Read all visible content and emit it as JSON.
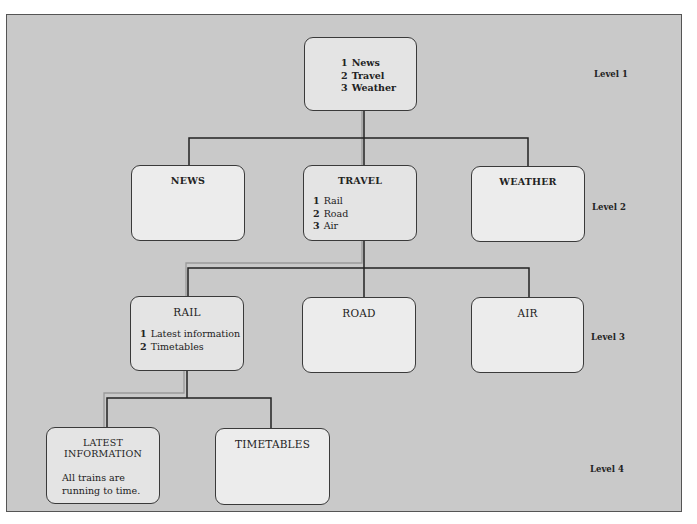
{
  "diagram": {
    "type": "menu-hierarchy",
    "colors": {
      "background": "#c9c9c9",
      "box_fill": "#e4e4e4",
      "box_fill_light": "#ececec",
      "connector": "#222222",
      "path_highlight": "#9a9a9a"
    },
    "levels": [
      {
        "label": "Level 1"
      },
      {
        "label": "Level 2"
      },
      {
        "label": "Level 3"
      },
      {
        "label": "Level 4"
      }
    ],
    "nodes": {
      "root": {
        "items": [
          {
            "num": "1",
            "label": "News"
          },
          {
            "num": "2",
            "label": "Travel"
          },
          {
            "num": "3",
            "label": "Weather"
          }
        ]
      },
      "news": {
        "title": "NEWS"
      },
      "travel": {
        "title": "TRAVEL",
        "items": [
          {
            "num": "1",
            "label": "Rail"
          },
          {
            "num": "2",
            "label": "Road"
          },
          {
            "num": "3",
            "label": "Air"
          }
        ]
      },
      "weather": {
        "title": "WEATHER"
      },
      "rail": {
        "title": "RAIL",
        "items": [
          {
            "num": "1",
            "label": "Latest information"
          },
          {
            "num": "2",
            "label": "Timetables"
          }
        ]
      },
      "road": {
        "title": "ROAD"
      },
      "air": {
        "title": "AIR"
      },
      "latest_information": {
        "title": "LATEST INFORMATION",
        "body": "All trains are running to time."
      },
      "timetables": {
        "title": "TIMETABLES"
      }
    },
    "edges": [
      [
        "root",
        "news"
      ],
      [
        "root",
        "travel"
      ],
      [
        "root",
        "weather"
      ],
      [
        "travel",
        "rail"
      ],
      [
        "travel",
        "road"
      ],
      [
        "travel",
        "air"
      ],
      [
        "rail",
        "latest_information"
      ],
      [
        "rail",
        "timetables"
      ]
    ],
    "highlighted_path": [
      "root",
      "travel",
      "rail",
      "latest_information"
    ]
  }
}
